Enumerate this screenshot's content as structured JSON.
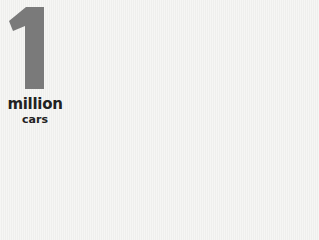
{
  "stat": {
    "number": "1",
    "unit": "million",
    "subject": "cars"
  },
  "colors": {
    "numeral": "#7a7a7a",
    "text": "#222222",
    "background": "#f4f4f2"
  }
}
